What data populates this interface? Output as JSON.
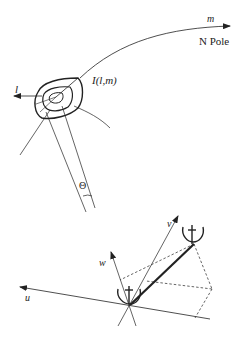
{
  "diagram": {
    "top_panel": {
      "axis_m_label": "m",
      "pole_label": "N Pole",
      "axis_l_label": "l",
      "source_label": "I(l,m)",
      "angle_label": "Θ"
    },
    "bottom_panel": {
      "axis_u_label": "u",
      "axis_v_label": "v",
      "axis_w_label": "w",
      "antennas": [
        "antenna-1",
        "antenna-2"
      ]
    },
    "colors": {
      "stroke": "#222222",
      "background": "#ffffff"
    }
  }
}
